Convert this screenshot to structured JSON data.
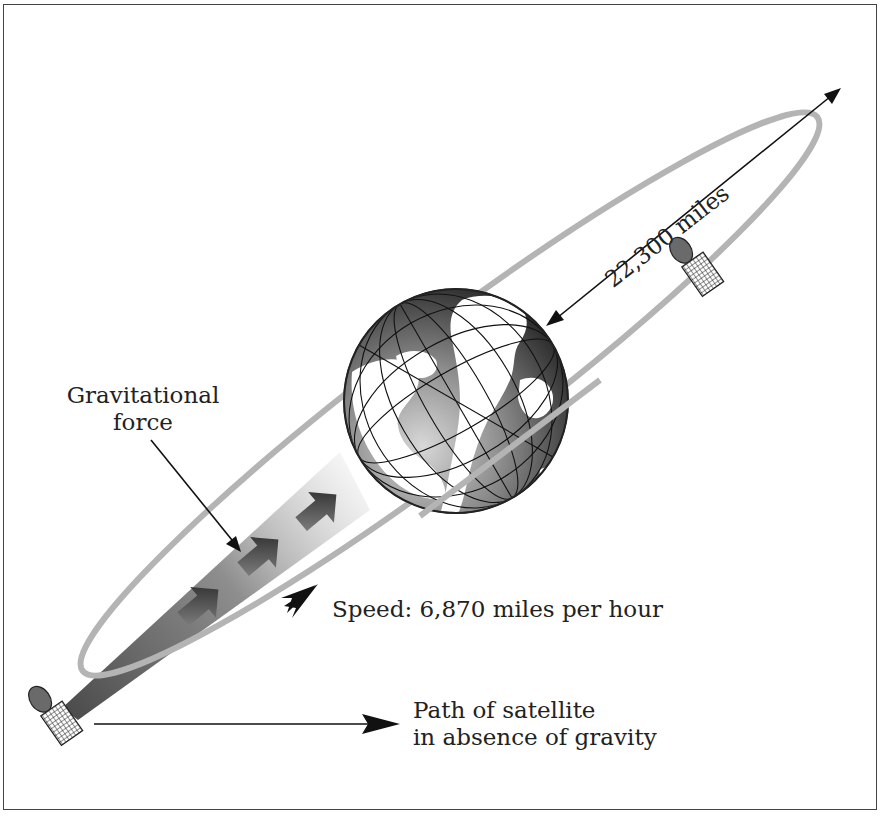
{
  "diagram": {
    "labels": {
      "gravitational_force_line1": "Gravitational",
      "gravitational_force_line2": "force",
      "distance": "22,300 miles",
      "speed": "Speed: 6,870 miles per hour",
      "path_line1": "Path of satellite",
      "path_line2": "in absence of gravity"
    },
    "elements": [
      {
        "name": "orbit-ellipse",
        "color": "#b4b4b4"
      },
      {
        "name": "earth-globe",
        "colors": {
          "land": "#ffffff",
          "ocean_light": "#9a9a9a",
          "ocean_dark": "#222222",
          "grid": "#111111"
        }
      },
      {
        "name": "satellite-near",
        "position": "upper-right"
      },
      {
        "name": "satellite-far",
        "position": "lower-left"
      },
      {
        "name": "gravity-cone",
        "color": "#555555"
      },
      {
        "name": "gravity-arrows",
        "count": 3
      }
    ],
    "colors": {
      "frame": "#444444",
      "orbit": "#b4b4b4",
      "arrow": "#1a1a1a",
      "text": "#222222"
    }
  }
}
